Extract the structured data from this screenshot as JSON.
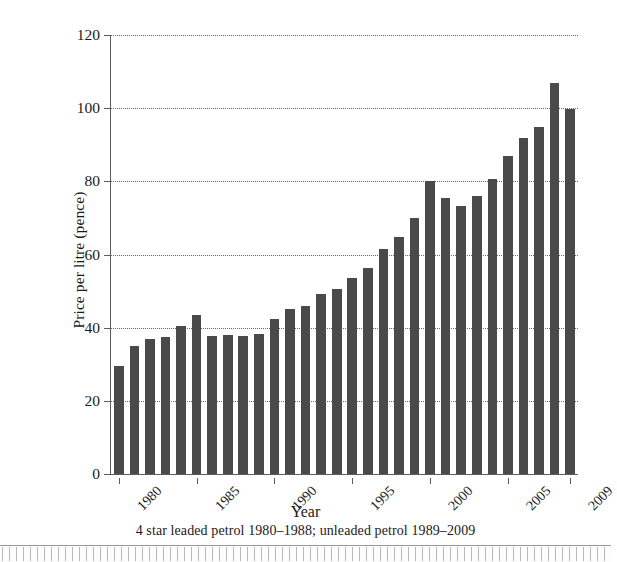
{
  "chart_data": {
    "type": "bar",
    "title": "",
    "xlabel": "Year",
    "ylabel": "Price per litre (pence)",
    "caption": "4 star leaded petrol 1980–1988; unleaded petrol 1989–2009",
    "ylim": [
      0,
      120
    ],
    "yticks": [
      0,
      20,
      40,
      60,
      80,
      100,
      120
    ],
    "ytick_labels": [
      "0",
      "20",
      "40",
      "60",
      "80",
      "100",
      "120"
    ],
    "xtick_labels": [
      "1980",
      "1985",
      "1990",
      "1995",
      "2000",
      "2005",
      "2009"
    ],
    "xtick_categories": [
      "1980",
      "1985",
      "1990",
      "1995",
      "2000",
      "2005",
      "2009"
    ],
    "grid": true,
    "grid_axis": "y",
    "grid_style": "dotted",
    "legend": false,
    "bar_color": "#4a4a4a",
    "axis_color": "#5c5c5c",
    "categories": [
      "1980",
      "1981",
      "1982",
      "1983",
      "1984",
      "1985",
      "1986",
      "1987",
      "1988",
      "1989",
      "1990",
      "1991",
      "1992",
      "1993",
      "1994",
      "1995",
      "1996",
      "1997",
      "1998",
      "1999",
      "2000",
      "2001",
      "2002",
      "2003",
      "2004",
      "2005",
      "2006",
      "2007",
      "2008",
      "2009"
    ],
    "values": [
      29.4,
      35.0,
      36.8,
      37.4,
      40.5,
      43.4,
      37.8,
      38.1,
      37.6,
      38.4,
      42.4,
      45.1,
      45.9,
      49.1,
      50.6,
      53.6,
      56.4,
      61.6,
      64.7,
      70.0,
      80.1,
      75.5,
      73.3,
      76.1,
      80.6,
      86.9,
      91.8,
      94.8,
      107.0,
      99.7
    ],
    "series": [
      {
        "name": "Price per litre (pence)",
        "values": [
          29.4,
          35.0,
          36.8,
          37.4,
          40.5,
          43.4,
          37.8,
          38.1,
          37.6,
          38.4,
          42.4,
          45.1,
          45.9,
          49.1,
          50.6,
          53.6,
          56.4,
          61.6,
          64.7,
          70.0,
          80.1,
          75.5,
          73.3,
          76.1,
          80.6,
          86.9,
          91.8,
          94.8,
          107.0,
          99.7
        ]
      }
    ]
  }
}
